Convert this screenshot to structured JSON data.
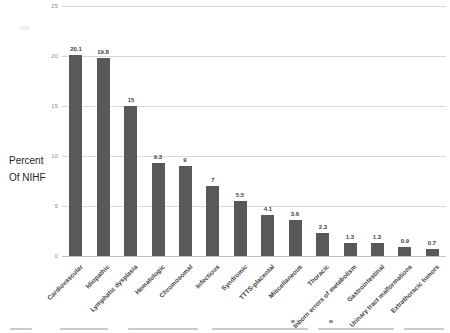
{
  "chart_data": {
    "type": "bar",
    "title": "",
    "xlabel": "",
    "ylabel_line1": "Percent",
    "ylabel_line2": "Of NIHF",
    "categories": [
      "Cardiovascular",
      "Idiopathic",
      "Lymphatic dysplasia",
      "Hematologic",
      "Chromosomal",
      "Infectious",
      "Syndromic",
      "TTTS-placental",
      "Miscellaneous",
      "Thoracic",
      "Inborn errors of metabolism",
      "Gastrointestinal",
      "Urinary tract malformations",
      "Extrathoracic tumors"
    ],
    "values": [
      20.1,
      19.8,
      15,
      9.3,
      9,
      7,
      5.5,
      4.1,
      3.6,
      2.3,
      1.3,
      1.3,
      0.9,
      0.7
    ],
    "data_labels": [
      "20.1",
      "19.8",
      "15",
      "9.3",
      "9",
      "7",
      "5.5",
      "4.1",
      "3.6",
      "2.3",
      "1.3",
      "1.3",
      "0.9",
      "0.7"
    ],
    "y_ticks": [
      0,
      5,
      10,
      15,
      20,
      25
    ],
    "ylim": [
      0,
      25
    ],
    "grid": true,
    "legend": false,
    "bar_color": "#595959",
    "gridline_color": "#d9d9d9",
    "label_rotation_deg": 45
  }
}
